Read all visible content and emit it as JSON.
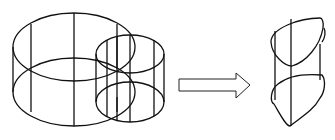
{
  "diagram": {
    "left_figure": {
      "label": "",
      "large_cylinder": {
        "cx": 74,
        "top_cy": 47,
        "bottom_cy": 92,
        "rx": 61,
        "ry": 34
      },
      "small_cylinder": {
        "cx": 130,
        "top_cy": 54,
        "bottom_cy": 102,
        "rx": 34,
        "ry": 20
      }
    },
    "arrow": {
      "direction": "right",
      "style": "hollow"
    },
    "right_figure": {
      "label": "",
      "shape": "lens-shaped prism (cylinder intersection)"
    },
    "colors": {
      "stroke": "#111111",
      "background": "#ffffff"
    }
  }
}
